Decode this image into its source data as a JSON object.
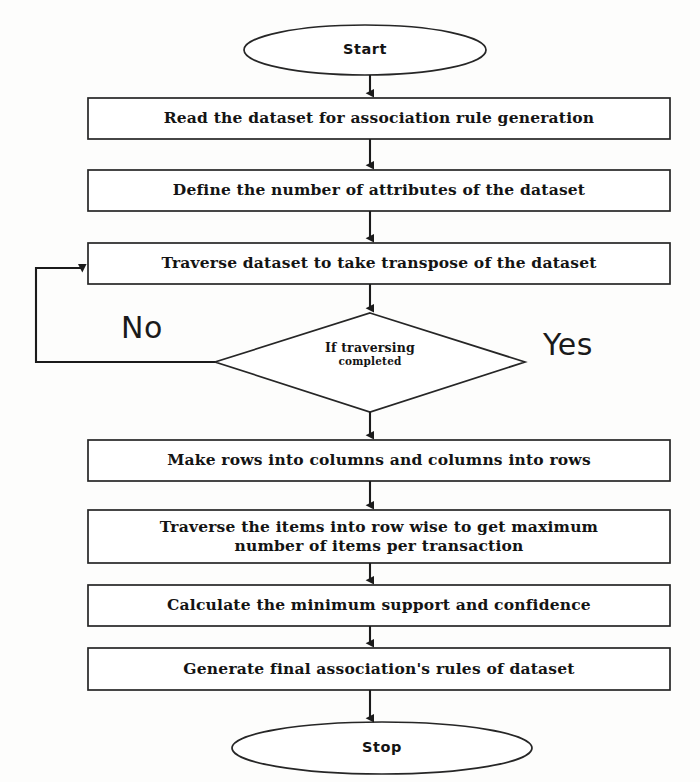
{
  "diagram": {
    "type": "flowchart",
    "stroke_color": "#222222",
    "fill_color": "#ffffff",
    "background_color": "#fdfdfc",
    "nodes": [
      {
        "id": "start",
        "shape": "terminator",
        "label": "Start"
      },
      {
        "id": "read",
        "shape": "process",
        "label": "Read the dataset for association rule generation"
      },
      {
        "id": "define",
        "shape": "process",
        "label": "Define the number of attributes of the dataset"
      },
      {
        "id": "traverse",
        "shape": "process",
        "label": "Traverse dataset to take transpose of the dataset"
      },
      {
        "id": "decision",
        "shape": "decision",
        "label_line1": "If traversing",
        "label_line2": "completed"
      },
      {
        "id": "makerows",
        "shape": "process",
        "label": "Make rows into columns and columns into rows"
      },
      {
        "id": "traverserow",
        "shape": "process",
        "label_line1": "Traverse the items into row wise to get maximum",
        "label_line2": "number of items per transaction"
      },
      {
        "id": "calculate",
        "shape": "process",
        "label": "Calculate the minimum support and confidence"
      },
      {
        "id": "generate",
        "shape": "process",
        "label": "Generate final association's rules of dataset"
      },
      {
        "id": "stop",
        "shape": "terminator",
        "label": "Stop"
      }
    ],
    "branch_labels": {
      "no": "No",
      "yes": "Yes"
    }
  }
}
